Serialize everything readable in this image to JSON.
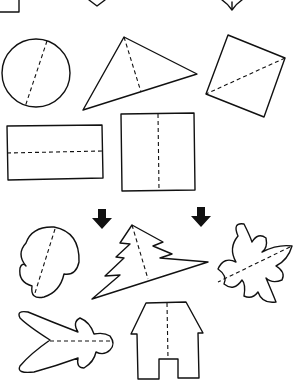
{
  "worksheet": {
    "description": "Symmetry fold-line shapes worksheet",
    "colors": {
      "stroke": "#111111",
      "background": "#ffffff"
    },
    "shapes": [
      {
        "name": "partial-square-top-left"
      },
      {
        "name": "partial-diamond-top-center"
      },
      {
        "name": "partial-heart-top-right"
      },
      {
        "name": "circle",
        "fold": "diagonal"
      },
      {
        "name": "triangle",
        "fold": "altitude"
      },
      {
        "name": "square-rotated",
        "fold": "diagonal"
      },
      {
        "name": "rectangle",
        "fold": "horizontal"
      },
      {
        "name": "square",
        "fold": "vertical"
      },
      {
        "name": "mushroom-blob",
        "fold": "diagonal"
      },
      {
        "name": "fir-tree",
        "fold": "diagonal",
        "marked": true
      },
      {
        "name": "flower",
        "fold": "diagonal",
        "marked": true
      },
      {
        "name": "leaf-sprig",
        "fold": "horizontal"
      },
      {
        "name": "house",
        "fold": "vertical"
      }
    ],
    "markers": [
      "down-arrow",
      "down-arrow"
    ]
  }
}
